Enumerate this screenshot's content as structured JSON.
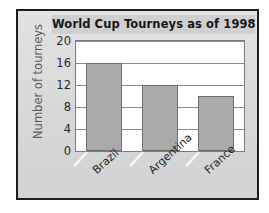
{
  "chart_data": {
    "type": "bar",
    "title": "World Cup Tourneys as of 1998",
    "xlabel": "",
    "ylabel": "Number of tourneys",
    "categories": [
      "Brazil",
      "Argentina",
      "France"
    ],
    "values": [
      16,
      12,
      10
    ],
    "yticks": [
      0,
      4,
      8,
      12,
      16,
      20
    ],
    "ylim": [
      0,
      20
    ],
    "grid": true,
    "legend": false,
    "colors": {
      "bar_fill": "#aaaaaa",
      "bar_stroke": "#6f6f6f",
      "plot_background": "#ffffff",
      "card_background": "#dcdcdc",
      "frame": "#1d1d1d",
      "title_band": "#cfcfcf",
      "title_text": "#16161a",
      "axis_label_text": "#5d5d60",
      "tick_text": "#2a2a2c",
      "gridline": "#8b8b8b"
    }
  }
}
